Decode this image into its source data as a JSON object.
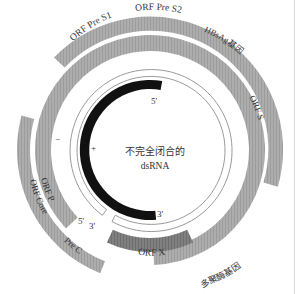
{
  "diagram": {
    "center_label_line1": "不完全闭合的",
    "center_label_line2": "dsRNA",
    "colors": {
      "gene_band": "#a9a9a9",
      "orf_x_band": "#7d7d7d",
      "strand_minus_ring": "#ffffff",
      "strand_plus_arc": "#111111",
      "ring_stroke": "#9a9a9a",
      "text": "#333333"
    },
    "genes": [
      {
        "id": "orf-pre-s1",
        "label": "ORF Pre S1"
      },
      {
        "id": "orf-pre-s2",
        "label": "ORF Pre S2"
      },
      {
        "id": "hbsag-gene",
        "label": "HBsAg基因"
      },
      {
        "id": "orf-s",
        "label": "ORF S"
      },
      {
        "id": "orf-p",
        "label": "ORF P"
      },
      {
        "id": "orf-core",
        "label": "ORF Core"
      },
      {
        "id": "pre-c",
        "label": "Pre C"
      },
      {
        "id": "orf-x",
        "label": "ORF X"
      },
      {
        "id": "polymerase-gene",
        "label": "多聚酶基因"
      }
    ],
    "strand_labels": {
      "minus_sign": "−",
      "plus_sign": "+",
      "plus_5prime": "5'",
      "plus_3prime": "3'",
      "minus_5prime": "5'",
      "minus_3prime": "3'"
    }
  }
}
